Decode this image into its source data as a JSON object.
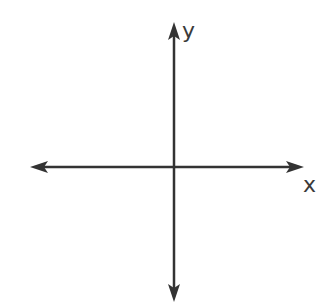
{
  "diagram": {
    "type": "coordinate-plane",
    "axes": {
      "x": {
        "label": "x",
        "arrows": "both"
      },
      "y": {
        "label": "y",
        "arrows": "both"
      }
    },
    "colors": {
      "axis": "#333333",
      "label": "#3a3a3a",
      "background": "#ffffff"
    }
  }
}
